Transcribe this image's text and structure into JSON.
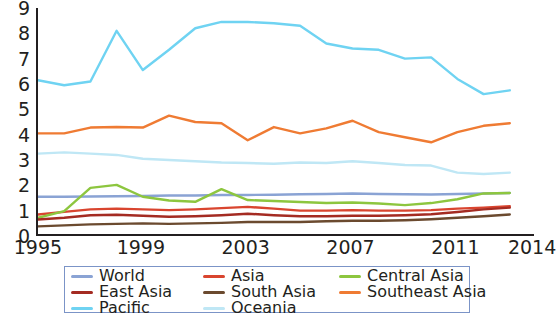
{
  "chart_data": {
    "type": "line",
    "title": "",
    "xlabel": "",
    "ylabel": "",
    "xlim": [
      1995,
      2014
    ],
    "ylim": [
      0,
      9
    ],
    "grid": false,
    "legend_position": "bottom",
    "x_ticks": [
      "1995",
      "1999",
      "2003",
      "2007",
      "2011",
      "2014"
    ],
    "y_ticks": [
      "0",
      "1",
      "2",
      "3",
      "4",
      "5",
      "6",
      "7",
      "8",
      "9"
    ],
    "x": [
      1995,
      1996,
      1997,
      1998,
      1999,
      2000,
      2001,
      2002,
      2003,
      2004,
      2005,
      2006,
      2007,
      2008,
      2009,
      2010,
      2011,
      2012,
      2013
    ],
    "series": [
      {
        "name": "World",
        "color": "#8aa3d4",
        "values": [
          1.55,
          1.55,
          1.56,
          1.57,
          1.58,
          1.6,
          1.6,
          1.62,
          1.62,
          1.63,
          1.65,
          1.66,
          1.68,
          1.66,
          1.65,
          1.64,
          1.66,
          1.68,
          1.7
        ]
      },
      {
        "name": "Asia",
        "color": "#d9452f",
        "values": [
          0.85,
          0.95,
          1.05,
          1.08,
          1.05,
          1.02,
          1.05,
          1.1,
          1.15,
          1.08,
          1.0,
          1.0,
          1.02,
          1.0,
          1.0,
          1.02,
          1.08,
          1.12,
          1.18
        ]
      },
      {
        "name": "Central Asia",
        "color": "#8dc63f",
        "values": [
          0.72,
          0.98,
          1.9,
          2.02,
          1.55,
          1.4,
          1.35,
          1.85,
          1.42,
          1.38,
          1.34,
          1.3,
          1.32,
          1.28,
          1.22,
          1.3,
          1.45,
          1.68,
          1.7
        ]
      },
      {
        "name": "East Asia",
        "color": "#a42b22",
        "values": [
          0.65,
          0.72,
          0.82,
          0.84,
          0.8,
          0.76,
          0.78,
          0.82,
          0.88,
          0.82,
          0.78,
          0.78,
          0.8,
          0.8,
          0.82,
          0.86,
          0.95,
          1.05,
          1.12
        ]
      },
      {
        "name": "South Asia",
        "color": "#6b4a2f",
        "values": [
          0.38,
          0.42,
          0.46,
          0.48,
          0.5,
          0.48,
          0.5,
          0.52,
          0.55,
          0.55,
          0.55,
          0.58,
          0.6,
          0.6,
          0.62,
          0.66,
          0.72,
          0.78,
          0.85
        ]
      },
      {
        "name": "Southeast Asia",
        "color": "#ef7b33",
        "values": [
          4.05,
          4.05,
          4.28,
          4.3,
          4.28,
          4.75,
          4.5,
          4.45,
          3.78,
          4.3,
          4.05,
          4.25,
          4.55,
          4.1,
          3.9,
          3.7,
          4.1,
          4.35,
          4.45
        ]
      },
      {
        "name": "Pacific",
        "color": "#6fd3f2",
        "values": [
          6.15,
          5.95,
          6.1,
          8.1,
          6.55,
          7.35,
          8.2,
          8.45,
          8.45,
          8.4,
          8.3,
          7.6,
          7.4,
          7.35,
          7.0,
          7.05,
          6.2,
          5.6,
          5.75
        ]
      },
      {
        "name": "Oceania",
        "color": "#bfe7f5",
        "values": [
          3.25,
          3.3,
          3.25,
          3.2,
          3.05,
          3.0,
          2.95,
          2.9,
          2.88,
          2.85,
          2.9,
          2.88,
          2.95,
          2.88,
          2.8,
          2.78,
          2.5,
          2.45,
          2.5
        ]
      }
    ]
  },
  "legend": {
    "rows": [
      [
        {
          "label": "World",
          "color": "#8aa3d4"
        },
        {
          "label": "Asia",
          "color": "#d9452f"
        },
        {
          "label": "Central Asia",
          "color": "#8dc63f"
        }
      ],
      [
        {
          "label": "East Asia",
          "color": "#a42b22"
        },
        {
          "label": "South Asia",
          "color": "#6b4a2f"
        },
        {
          "label": "Southeast Asia",
          "color": "#ef7b33"
        }
      ],
      [
        {
          "label": "Pacific",
          "color": "#6fd3f2"
        },
        {
          "label": "Oceania",
          "color": "#bfe7f5"
        },
        {
          "label": "",
          "color": ""
        }
      ]
    ]
  }
}
